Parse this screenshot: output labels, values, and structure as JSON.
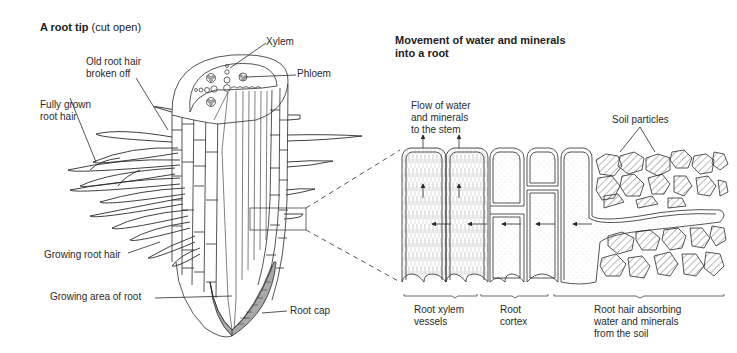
{
  "panel_a": {
    "letter": "A",
    "title": "A root tip",
    "subtitle": "(cut open)",
    "labels": {
      "xylem": "Xylem",
      "phloem": "Phloem",
      "old_root_hair": "Old root hair\nbroken off",
      "fully_grown_root_hair": "Fully grown\nroot hair",
      "growing_root_hair": "Growing root hair",
      "growing_area": "Growing area of root",
      "root_cap": "Root cap"
    }
  },
  "panel_b": {
    "letter": "B",
    "title": "Movement of water and minerals\ninto a root",
    "labels": {
      "flow": "Flow of water\nand minerals\nto the stem",
      "soil_particles": "Soil particles",
      "root_xylem_vessels": "Root xylem\nvessels",
      "root_cortex": "Root\ncortex",
      "root_hair_absorbing": "Root hair absorbing\nwater and minerals\nfrom the soil"
    }
  },
  "colors": {
    "line": "#2a2a2a",
    "root_cap_fill": "#a9a9a9",
    "background": "#ffffff"
  }
}
